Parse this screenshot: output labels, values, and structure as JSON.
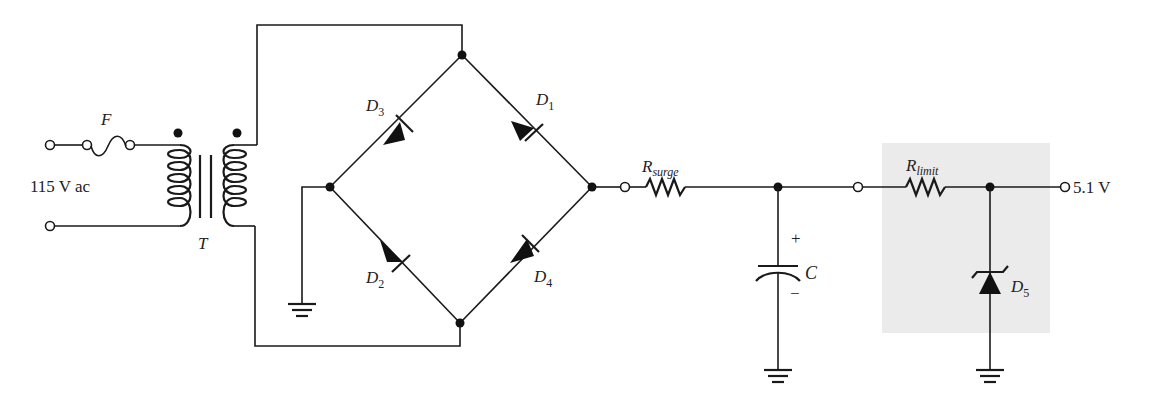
{
  "diagram": {
    "type": "circuit-schematic",
    "colors": {
      "wire": "#1a1a1a",
      "regulator_shading": "#ebebeb",
      "background": "#ffffff"
    },
    "input": {
      "label": "115 V ac"
    },
    "fuse": {
      "label": "F"
    },
    "transformer": {
      "label": "T"
    },
    "diodes": [
      {
        "label_main": "D",
        "label_sub": "1"
      },
      {
        "label_main": "D",
        "label_sub": "2"
      },
      {
        "label_main": "D",
        "label_sub": "3"
      },
      {
        "label_main": "D",
        "label_sub": "4"
      },
      {
        "label_main": "D",
        "label_sub": "5"
      }
    ],
    "r_surge": {
      "label_main": "R",
      "label_sub": "surge"
    },
    "capacitor": {
      "label": "C",
      "plus": "+",
      "minus": "−"
    },
    "r_limit": {
      "label_main": "R",
      "label_sub": "limit"
    },
    "output": {
      "label": "5.1 V"
    }
  }
}
